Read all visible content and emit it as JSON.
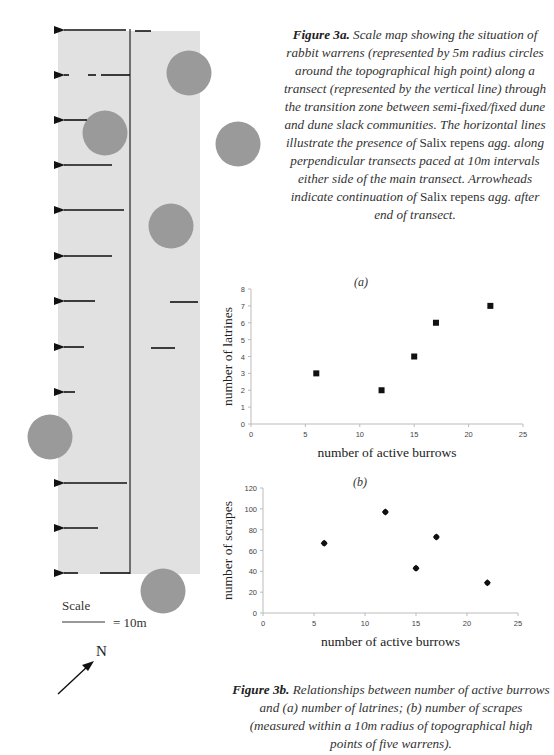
{
  "figure_3a": {
    "title_bold": "Figure 3a.",
    "caption_part1": " Scale map showing the situation of rabbit warrens (represented by 5m radius circles around the topographical high point) along a transect (represented by the vertical line) through the transition zone between semi-fixed/fixed dune and dune slack communities. The horizontal lines illustrate the presence of ",
    "species_1": "Salix repens",
    "caption_part2": " agg. along perpendicular transects paced at 10m intervals either side of the main transect. Arrowheads indicate continuation of ",
    "species_2": "Salix repens",
    "caption_part3": " agg. after end of transect.",
    "scale_label": "Scale",
    "scale_value": "= 10m",
    "north_label": "N",
    "colors": {
      "zone_fill": "#e1e1e1",
      "warren_fill": "#9a9a9a",
      "line": "#111111"
    }
  },
  "figure_3b": {
    "title_bold": "Figure 3b.",
    "caption": " Relationships between number of active burrows and (a) number of latrines; (b) number of scrapes (measured within a 10m radius of topographical high points of five warrens)."
  },
  "chart_data": [
    {
      "type": "scatter",
      "title": "(a)",
      "xlabel": "number of active burrows",
      "ylabel": "number of latrines",
      "xlim": [
        0,
        25
      ],
      "ylim": [
        0,
        8
      ],
      "x_ticks": [
        0,
        5,
        10,
        15,
        20,
        25
      ],
      "y_ticks": [
        0,
        1,
        2,
        3,
        4,
        5,
        6,
        7,
        8
      ],
      "marker": "square",
      "grid": false,
      "x": [
        6,
        12,
        15,
        17,
        22
      ],
      "y": [
        3,
        2,
        4,
        6,
        7
      ]
    },
    {
      "type": "scatter",
      "title": "(b)",
      "xlabel": "number of active burrows",
      "ylabel": "number of scrapes",
      "xlim": [
        0,
        25
      ],
      "ylim": [
        0,
        120
      ],
      "x_ticks": [
        0,
        5,
        10,
        15,
        20,
        25
      ],
      "y_ticks": [
        0,
        20,
        40,
        60,
        80,
        100,
        120
      ],
      "marker": "diamond",
      "grid": false,
      "x": [
        6,
        12,
        15,
        17,
        22
      ],
      "y": [
        67,
        97,
        43,
        73,
        29
      ]
    }
  ]
}
